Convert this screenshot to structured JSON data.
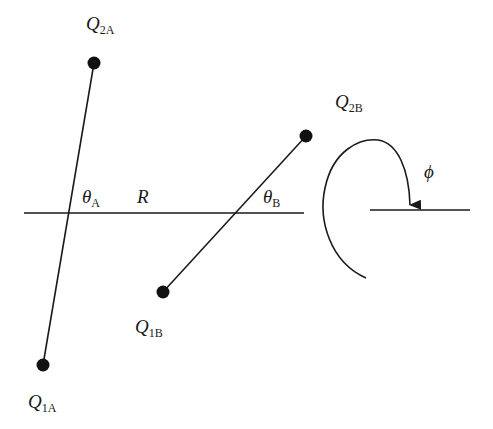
{
  "diagram": {
    "type": "molecular-geometry",
    "colors": {
      "ink": "#1a1a1a",
      "background": "#ffffff"
    },
    "charges": {
      "q2a": {
        "symbol": "Q",
        "subscript": "2A",
        "x": 94,
        "y": 63
      },
      "q1a": {
        "symbol": "Q",
        "subscript": "1A",
        "x": 43,
        "y": 365
      },
      "q2b": {
        "symbol": "Q",
        "subscript": "2B",
        "x": 306,
        "y": 136
      },
      "q1b": {
        "symbol": "Q",
        "subscript": "1B",
        "x": 163,
        "y": 292
      }
    },
    "angles": {
      "theta_a": {
        "symbol": "θ",
        "subscript": "A"
      },
      "theta_b": {
        "symbol": "θ",
        "subscript": "B"
      },
      "phi": {
        "symbol": "ϕ"
      }
    },
    "distance": {
      "symbol": "R"
    }
  }
}
